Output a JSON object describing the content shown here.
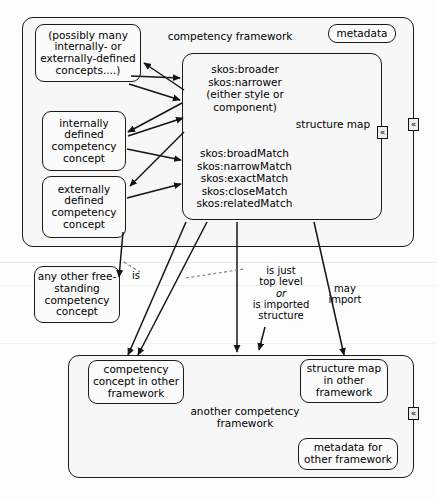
{
  "diagram": {
    "stroke_color": "#1a1a1a",
    "background_color": "#fdfdfd",
    "box_fill": "#fbfbfb",
    "container_fill": "#f7f7f7"
  },
  "upper_framework": {
    "label": "competency framework",
    "metadata_label": "metadata",
    "concepts": [
      {
        "id": "possibly-many",
        "label": "(possibly many internally- or externally-defined concepts....)"
      },
      {
        "id": "internally-defined",
        "label": "internally defined competency concept"
      },
      {
        "id": "externally-defined",
        "label": "externally defined competency concept"
      }
    ],
    "structure_map": {
      "label": "structure map",
      "hierarchy_relations": "skos:broader\nskos:narrower\n(either style or\ncomponent)",
      "match_relations": "skos:broadMatch\nskos:narrowMatch\nskos:exactMatch\nskos:closeMatch\nskos:relatedMatch"
    }
  },
  "free_standing": {
    "label": "any other free-standing competency concept"
  },
  "edge_labels": {
    "is": "is",
    "top_level_line1": "is just",
    "top_level_line2": "top level",
    "top_level_or": "or",
    "top_level_line3": "is imported",
    "top_level_line4": "structure",
    "may_import_line1": "may",
    "may_import_line2": "import"
  },
  "other_framework": {
    "label": "another competency framework",
    "concept_label": "competency concept in other framework",
    "structure_map_label": "structure map in other framework",
    "metadata_label": "metadata for other framework"
  },
  "handles": {
    "glyph": "«",
    "count_upper_outer": 1,
    "count_upper_inner": 1,
    "count_lower": 1
  }
}
